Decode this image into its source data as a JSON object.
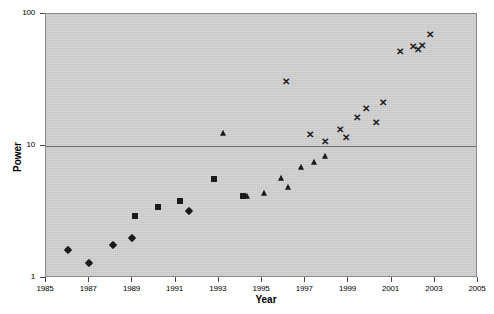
{
  "chart_data": {
    "type": "scatter",
    "title": "",
    "xlabel": "Year",
    "ylabel": "Power",
    "xlim": [
      1985,
      2005
    ],
    "ylim": [
      1,
      100
    ],
    "yscale": "log",
    "xticks": [
      1985,
      1987,
      1989,
      1991,
      1993,
      1995,
      1997,
      1999,
      2001,
      2003,
      2005
    ],
    "xtick_labels": [
      "1985",
      "1987",
      "1989",
      "1991",
      "1993",
      "1995",
      "1997",
      "1999",
      "2001",
      "2003",
      "2005"
    ],
    "yticks": [
      1,
      10,
      100
    ],
    "ytick_labels": [
      "1",
      "10",
      "100"
    ],
    "grid": "horizontal-major",
    "legend": "none",
    "plot_background": "#d2d2d2",
    "marker_color": "#111111",
    "series": [
      {
        "name": "diamond-series",
        "marker": "diamond",
        "points": [
          {
            "x": 1986.0,
            "y": 1.62
          },
          {
            "x": 1987.0,
            "y": 1.31
          },
          {
            "x": 1988.1,
            "y": 1.78
          },
          {
            "x": 1989.0,
            "y": 2.0
          },
          {
            "x": 1991.6,
            "y": 3.2
          }
        ]
      },
      {
        "name": "square-series",
        "marker": "square",
        "points": [
          {
            "x": 1989.1,
            "y": 2.95
          },
          {
            "x": 1990.2,
            "y": 3.45
          },
          {
            "x": 1991.2,
            "y": 3.85
          },
          {
            "x": 1992.8,
            "y": 5.6
          },
          {
            "x": 1994.1,
            "y": 4.2
          }
        ]
      },
      {
        "name": "triangle-series",
        "marker": "triangle",
        "points": [
          {
            "x": 1993.2,
            "y": 12.5
          },
          {
            "x": 1994.3,
            "y": 4.15
          },
          {
            "x": 1995.1,
            "y": 4.4
          },
          {
            "x": 1995.9,
            "y": 5.75
          },
          {
            "x": 1996.2,
            "y": 4.85
          },
          {
            "x": 1996.8,
            "y": 6.9
          },
          {
            "x": 1997.4,
            "y": 7.6
          },
          {
            "x": 1997.9,
            "y": 8.35
          }
        ]
      },
      {
        "name": "cross-series",
        "marker": "x",
        "points": [
          {
            "x": 1996.1,
            "y": 31.0
          },
          {
            "x": 1997.2,
            "y": 12.3
          },
          {
            "x": 1997.9,
            "y": 10.9
          },
          {
            "x": 1998.6,
            "y": 13.5
          },
          {
            "x": 1998.9,
            "y": 11.8
          },
          {
            "x": 1999.4,
            "y": 16.5
          },
          {
            "x": 1999.8,
            "y": 19.5
          },
          {
            "x": 2000.3,
            "y": 15.2
          },
          {
            "x": 2000.6,
            "y": 21.5
          },
          {
            "x": 2001.4,
            "y": 52.0
          },
          {
            "x": 2002.0,
            "y": 57.0
          },
          {
            "x": 2002.2,
            "y": 54.0
          },
          {
            "x": 2002.4,
            "y": 58.0
          },
          {
            "x": 2002.8,
            "y": 70.0
          }
        ]
      }
    ]
  }
}
